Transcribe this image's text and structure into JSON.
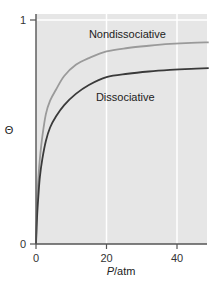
{
  "chart_data": {
    "type": "line",
    "title": "",
    "xlabel": "P/atm",
    "xlabel_italic_part": "P",
    "xlabel_rest": "/atm",
    "ylabel": "Θ",
    "xlim": [
      0,
      49
    ],
    "ylim": [
      0,
      1
    ],
    "x_ticks": [
      0,
      20,
      40
    ],
    "x_tick_labels": [
      "0",
      "20",
      "40"
    ],
    "y_ticks": [
      0,
      1
    ],
    "y_tick_labels": [
      "0",
      "1"
    ],
    "grid": {
      "vertical_at": [
        20,
        40
      ],
      "horizontal_at": [
        1
      ],
      "color": "#ffffff"
    },
    "background": "#e6e6e6",
    "legend": "inline labels",
    "series": [
      {
        "name": "Nondissociative",
        "color": "#9a9a9a",
        "label_position": {
          "x": 15,
          "y": 0.92
        },
        "x": [
          0,
          0.3,
          0.7,
          1.1,
          1.8,
          2.8,
          4,
          5.7,
          8,
          11.3,
          15,
          20,
          26,
          32,
          38,
          44,
          49
        ],
        "values": [
          0,
          0.18,
          0.3,
          0.38,
          0.48,
          0.58,
          0.64,
          0.69,
          0.75,
          0.8,
          0.83,
          0.86,
          0.875,
          0.885,
          0.893,
          0.898,
          0.9
        ]
      },
      {
        "name": "Dissociative",
        "color": "#3a3a3a",
        "label_position": {
          "x": 17,
          "y": 0.64
        },
        "x": [
          0,
          0.3,
          0.7,
          1.1,
          1.8,
          2.8,
          4,
          5.7,
          8,
          11.3,
          15,
          20,
          26,
          32,
          38,
          44,
          49
        ],
        "values": [
          0,
          0.12,
          0.22,
          0.3,
          0.38,
          0.46,
          0.52,
          0.57,
          0.62,
          0.67,
          0.71,
          0.745,
          0.76,
          0.77,
          0.777,
          0.782,
          0.785
        ]
      }
    ]
  }
}
